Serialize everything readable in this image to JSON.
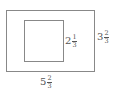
{
  "diagram": {
    "type": "nested-rectangles",
    "outer_rectangle": {
      "height_label": {
        "whole": "3",
        "numerator": "2",
        "denominator": "3"
      },
      "width_label": {
        "whole": "5",
        "numerator": "2",
        "denominator": "3"
      }
    },
    "inner_rectangle": {
      "side_label": {
        "whole": "2",
        "numerator": "1",
        "denominator": "3"
      }
    },
    "colors": {
      "stroke": "#888888",
      "text": "#555555",
      "background": "#ffffff"
    }
  }
}
